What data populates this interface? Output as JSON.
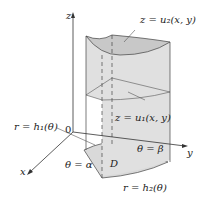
{
  "diagram": {
    "axes": {
      "z": "z",
      "y": "y",
      "x": "x",
      "origin": "0"
    },
    "labels": {
      "top_surface": "z = u₂(x, y)",
      "bottom_surface": "z = u₁(x, y)",
      "inner_curve": "r = h₁(θ)",
      "outer_curve": "r = h₂(θ)",
      "alpha": "θ = α",
      "beta": "θ = β",
      "region": "D"
    },
    "colors": {
      "fill": "#d9d9d9",
      "surface": "#c8c8c8",
      "line": "#333333"
    }
  }
}
